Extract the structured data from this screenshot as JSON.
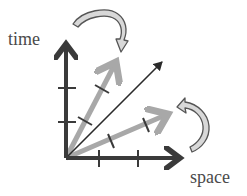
{
  "diagram": {
    "axes": {
      "time_label": "time",
      "space_label": "space"
    },
    "colors": {
      "axis": "#3a3a3a",
      "rotated_axis": "#a8a8a8",
      "diagonal": "#2a2a2a",
      "curved_arrow_fill": "#d8d8d8",
      "curved_arrow_stroke": "#555555",
      "label": "#4a4a4a"
    },
    "elements": [
      {
        "id": "time-axis",
        "type": "arrow",
        "from": [
          66,
          158
        ],
        "to": [
          66,
          38
        ],
        "ticks": 2
      },
      {
        "id": "space-axis",
        "type": "arrow",
        "from": [
          66,
          158
        ],
        "to": [
          186,
          158
        ],
        "ticks": 2
      },
      {
        "id": "rotated-time-axis",
        "type": "arrow",
        "from": [
          66,
          158
        ],
        "to": [
          118,
          58
        ],
        "ticks": 2
      },
      {
        "id": "rotated-space-axis",
        "type": "arrow",
        "from": [
          66,
          158
        ],
        "to": [
          172,
          113
        ],
        "ticks": 2
      },
      {
        "id": "light-line",
        "type": "arrow",
        "from": [
          66,
          158
        ],
        "to": [
          162,
          62
        ],
        "ticks": 0
      },
      {
        "id": "curved-arrow-top",
        "type": "curved-arrow",
        "direction": "from time axis toward rotated time axis"
      },
      {
        "id": "curved-arrow-right",
        "type": "curved-arrow",
        "direction": "from space axis toward rotated space axis"
      }
    ]
  }
}
